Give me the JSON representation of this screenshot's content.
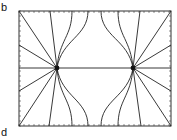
{
  "figure": {
    "panel_labels": {
      "top": "b",
      "bottom": "d"
    },
    "box": {
      "x0": 19,
      "y0": 11,
      "x1": 171,
      "y1": 126
    },
    "charges": [
      {
        "x": 57,
        "y": 68
      },
      {
        "x": 133,
        "y": 68
      }
    ],
    "line_color": "#222222",
    "top_endpoints_x": [
      19,
      50,
      72,
      88,
      101,
      118,
      140,
      171
    ],
    "bottom_endpoints_x": [
      19,
      49,
      72,
      88,
      101,
      118,
      141,
      171
    ],
    "side_endpoints_y": [
      45,
      68,
      91
    ]
  }
}
